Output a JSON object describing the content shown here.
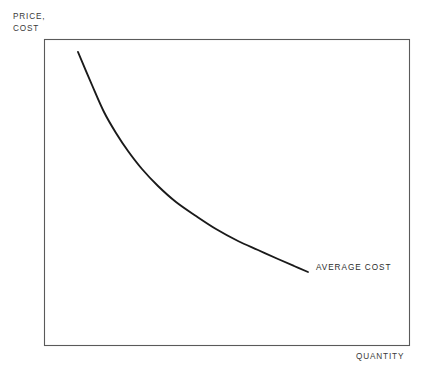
{
  "figure": {
    "background_color": "#ffffff",
    "frame_color": "#5a5a5a",
    "curve_color": "#1a1a1a",
    "text_color": "#2b2b2b"
  },
  "axes": {
    "y_title_line1": "PRICE,",
    "y_title_line2": "COST",
    "x_title": "QUANTITY"
  },
  "annotations": {
    "curve_label": "AVERAGE COST"
  },
  "chart_data": {
    "type": "line",
    "title": "",
    "subtitle": "",
    "xlabel": "QUANTITY",
    "ylabel": "PRICE, COST",
    "grid": false,
    "legend": false,
    "legend_position": "inline-right-end-of-curve",
    "axis_style": "box-frame-no-ticks",
    "xlim": [
      0,
      1
    ],
    "ylim": [
      0,
      1
    ],
    "x_tick_labels": [],
    "y_tick_labels": [],
    "series": [
      {
        "name": "AVERAGE COST",
        "label_text": "AVERAGE COST",
        "color": "#1a1a1a",
        "line_width": 1.9,
        "shape": "downward-sloping convex decreasing curve",
        "description": "Average cost falls steeply at low quantity then flattens as quantity rises, illustrating economies of scale.",
        "points_pixel": [
          [
            78,
            52
          ],
          [
            92,
            85
          ],
          [
            104,
            112
          ],
          [
            116,
            133
          ],
          [
            128,
            151
          ],
          [
            142,
            169
          ],
          [
            158,
            186
          ],
          [
            176,
            202
          ],
          [
            196,
            216
          ],
          [
            216,
            229
          ],
          [
            238,
            241
          ],
          [
            258,
            250
          ],
          [
            278,
            259
          ],
          [
            294,
            266
          ],
          [
            308,
            272
          ]
        ],
        "x": [
          0.09,
          0.13,
          0.16,
          0.2,
          0.23,
          0.27,
          0.31,
          0.36,
          0.42,
          0.47,
          0.53,
          0.59,
          0.64,
          0.68,
          0.72
        ],
        "y": [
          0.96,
          0.85,
          0.76,
          0.69,
          0.63,
          0.58,
          0.52,
          0.47,
          0.42,
          0.38,
          0.34,
          0.31,
          0.28,
          0.26,
          0.24
        ]
      }
    ]
  },
  "plot_frame": {
    "left": 44,
    "top": 39,
    "right": 409,
    "bottom": 345
  }
}
